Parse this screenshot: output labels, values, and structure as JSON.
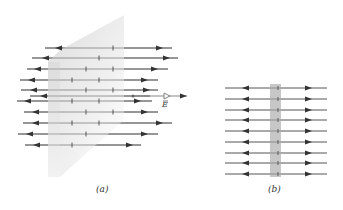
{
  "figure": {
    "panels": [
      {
        "id": "a",
        "caption": "(a)",
        "description": "Perspective view of a charged plane sheet with field lines pointing away on both sides",
        "plate": {
          "polygon": [
            [
              48,
              62
            ],
            [
              60,
              50
            ],
            [
              124,
              15
            ],
            [
              124,
              120
            ],
            [
              60,
              177
            ],
            [
              48,
              177
            ]
          ],
          "front_face": [
            [
              48,
              62
            ],
            [
              60,
              62
            ],
            [
              60,
              177
            ],
            [
              48,
              177
            ]
          ]
        },
        "field_lines": [
          {
            "y": 48,
            "x1": 45,
            "x2": 172,
            "left_arrow": 55,
            "right_arrow": 163,
            "ticks": [
              113
            ]
          },
          {
            "y": 58,
            "x1": 32,
            "x2": 178,
            "left_arrow": 42,
            "right_arrow": 170,
            "ticks": [
              99
            ]
          },
          {
            "y": 69,
            "x1": 27,
            "x2": 168,
            "left_arrow": 34,
            "right_arrow": 158,
            "ticks": [
              86,
              113
            ]
          },
          {
            "y": 80,
            "x1": 20,
            "x2": 158,
            "left_arrow": 28,
            "right_arrow": 148,
            "ticks": [
              72,
              99
            ]
          },
          {
            "y": 90,
            "x1": 21,
            "x2": 158,
            "left_arrow": 30,
            "right_arrow": 150,
            "ticks": [
              86,
              113
            ]
          },
          {
            "y": 96,
            "x1": 30,
            "x2": 150,
            "left_arrow": 40,
            "right_arrow": 0,
            "ticks": []
          },
          {
            "y": 101,
            "x1": 17,
            "x2": 152,
            "left_arrow": 24,
            "right_arrow": 141,
            "ticks": [
              72,
              99
            ]
          },
          {
            "y": 112,
            "x1": 24,
            "x2": 158,
            "left_arrow": 32,
            "right_arrow": 148,
            "ticks": [
              86,
              113
            ]
          },
          {
            "y": 123,
            "x1": 23,
            "x2": 172,
            "left_arrow": 32,
            "right_arrow": 163,
            "ticks": [
              72,
              99
            ]
          },
          {
            "y": 134,
            "x1": 18,
            "x2": 158,
            "left_arrow": 26,
            "right_arrow": 148,
            "ticks": [
              86
            ]
          },
          {
            "y": 145,
            "x1": 25,
            "x2": 141,
            "left_arrow": 33,
            "right_arrow": 133,
            "ticks": [
              72
            ]
          }
        ],
        "e_vector": {
          "label": "E",
          "y": 96,
          "x_start": 133,
          "x_arrow": 170,
          "x_end": 187,
          "label_x": 162,
          "label_y": 100
        },
        "caption_pos": {
          "x": 96,
          "y": 184
        }
      },
      {
        "id": "b",
        "caption": "(b)",
        "description": "Edge-on view of the charged sheet with field lines pointing away on both sides",
        "plate": {
          "x": 270,
          "y": 84,
          "width": 11,
          "height": 93
        },
        "field_lines_y": [
          88,
          99,
          110,
          120,
          131,
          142,
          153,
          163,
          174
        ],
        "x1": 225,
        "x2": 327,
        "left_arrow": 242,
        "right_arrow": 312,
        "tick_x": 278,
        "caption_pos": {
          "x": 268,
          "y": 184
        }
      }
    ],
    "colors": {
      "line": "#555555",
      "arrow": "#333333",
      "plate_light": "#e6e6e6",
      "plate_dark": "#c8c8c8",
      "plate_b": "#bdbdbd",
      "e_arrow_fill": "#ffffff"
    }
  }
}
